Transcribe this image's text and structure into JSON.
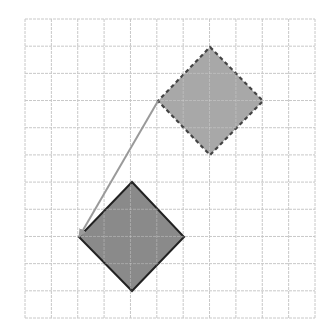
{
  "diagram": {
    "type": "grid-translation",
    "grid": {
      "columns": 11,
      "rows": 11,
      "x0": 25,
      "y0": 19,
      "x1": 315,
      "y1": 318,
      "line_color": "#c8c8c8"
    },
    "shapes": [
      {
        "id": "pre-image",
        "kind": "square-rotated-45",
        "style": "dashed",
        "points": [
          [
            210,
            47
          ],
          [
            263,
            101
          ],
          [
            210,
            155
          ],
          [
            158,
            101
          ]
        ],
        "fill": "#a8a8a8",
        "stroke": "#444444"
      },
      {
        "id": "image",
        "kind": "square-rotated-45",
        "style": "solid",
        "points": [
          [
            132,
            182
          ],
          [
            184,
            237
          ],
          [
            132,
            291
          ],
          [
            79,
            237
          ]
        ],
        "fill": "#8a8a8a",
        "stroke": "#222222"
      }
    ],
    "arrow": {
      "from": [
        158,
        101
      ],
      "to": [
        79,
        237
      ],
      "color": "#9a9a9a"
    }
  }
}
